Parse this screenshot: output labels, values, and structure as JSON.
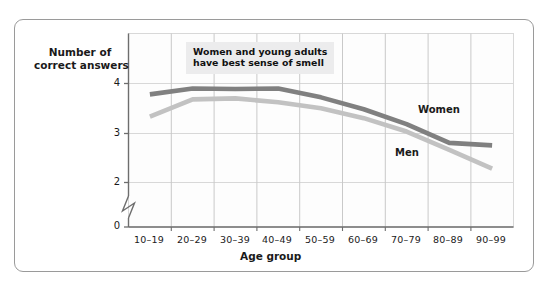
{
  "figure": {
    "frame_color": "#9a9a9a",
    "background": "#ffffff"
  },
  "annotation": {
    "line1": "Women and young adults",
    "line2": "have best sense of smell",
    "background": "#ececed"
  },
  "axes": {
    "y_title_line1": "Number of",
    "y_title_line2": "correct answers",
    "x_title": "Age group",
    "y_ticks": [
      "0",
      "2",
      "3",
      "4"
    ],
    "x_ticks": [
      "10–19",
      "20–29",
      "30–39",
      "40–49",
      "50–59",
      "60–69",
      "70–79",
      "80–89",
      "90–99"
    ],
    "axis_break": true,
    "grid_color": "#d8d8d8",
    "axis_color": "#6e6e6e"
  },
  "legend": {
    "women_label": "Women",
    "men_label": "Men"
  },
  "chart_data": {
    "type": "line",
    "title": "",
    "subtitle": "",
    "xlabel": "Age group",
    "ylabel": "Number of correct answers",
    "categories": [
      "10–19",
      "20–29",
      "30–39",
      "40–49",
      "50–59",
      "60–69",
      "70–79",
      "80–89",
      "90–99"
    ],
    "series": [
      {
        "name": "Women",
        "color": "#808080",
        "values": [
          3.78,
          3.9,
          3.89,
          3.9,
          3.72,
          3.48,
          3.18,
          2.8,
          2.75
        ]
      },
      {
        "name": "Men",
        "color": "#c2c2c2",
        "values": [
          3.33,
          3.68,
          3.7,
          3.62,
          3.5,
          3.3,
          3.03,
          2.66,
          2.28
        ]
      }
    ],
    "ylim": [
      1.55,
      4.45
    ],
    "yticks": [
      2,
      3,
      4
    ],
    "y_axis_break_at": 0,
    "grid": true,
    "legend_position": "inline-annotations",
    "annotations": [
      {
        "text": "Women and young adults have best sense of smell",
        "x": "20–29",
        "y": 4.3
      }
    ]
  }
}
